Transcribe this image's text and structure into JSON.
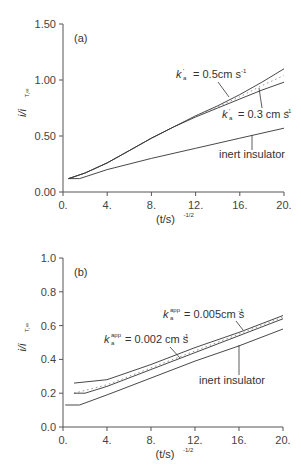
{
  "chart_data": [
    {
      "type": "line",
      "panel_label": "(a)",
      "xlabel": "(t/s)",
      "xlabel_exponent": "-1/2",
      "ylabel": "i/i",
      "ylabel_subscript": "T,∞",
      "xlim": [
        0,
        20
      ],
      "ylim": [
        0,
        1.5
      ],
      "xticks": [
        "0.",
        "4.",
        "8.",
        "12.",
        "16.",
        "20."
      ],
      "yticks": [
        "0.00",
        "0.50",
        "1.00",
        "1.50"
      ],
      "grid": false,
      "series": [
        {
          "name": "k'a = 0.5cm s-1",
          "style": "solid",
          "x": [
            0.5,
            2,
            4,
            6,
            8,
            10,
            12,
            14,
            16,
            18,
            20
          ],
          "y": [
            0.12,
            0.17,
            0.26,
            0.37,
            0.48,
            0.58,
            0.68,
            0.77,
            0.87,
            0.98,
            1.1
          ]
        },
        {
          "name": "dotted",
          "style": "dotted",
          "x": [
            0.5,
            2,
            4,
            6,
            8,
            10,
            12,
            14,
            16,
            18,
            20
          ],
          "y": [
            0.12,
            0.17,
            0.26,
            0.37,
            0.48,
            0.58,
            0.68,
            0.76,
            0.85,
            0.95,
            1.04
          ]
        },
        {
          "name": "k'a = 0.3 cm s-1",
          "style": "solid",
          "x": [
            0.5,
            2,
            4,
            6,
            8,
            10,
            12,
            14,
            16,
            18,
            20
          ],
          "y": [
            0.12,
            0.17,
            0.26,
            0.37,
            0.48,
            0.58,
            0.67,
            0.75,
            0.83,
            0.91,
            0.98
          ]
        },
        {
          "name": "inert insulator",
          "style": "solid",
          "x": [
            0.5,
            1.5,
            4,
            8,
            12,
            16,
            20
          ],
          "y": [
            0.12,
            0.12,
            0.2,
            0.3,
            0.39,
            0.48,
            0.57
          ]
        }
      ],
      "annotations": [
        {
          "text": "k'a = 0.5cm s-1",
          "k_sup": "'",
          "k_sub": "a",
          "value": "= 0.5cm s",
          "unit_exp": "-1"
        },
        {
          "text": "k'a = 0.3 cm s-1",
          "k_sup": "'",
          "k_sub": "a",
          "value": "= 0.3 cm s",
          "unit_exp": "-1"
        },
        {
          "text": "inert insulator"
        }
      ]
    },
    {
      "type": "line",
      "panel_label": "(b)",
      "xlabel": "(t/s)",
      "xlabel_exponent": "-1/2",
      "ylabel": "i/i",
      "ylabel_subscript": "T,∞",
      "xlim": [
        0,
        20
      ],
      "ylim": [
        0,
        1.0
      ],
      "xticks": [
        "0.",
        "4.",
        "8.",
        "12.",
        "16.",
        "20."
      ],
      "yticks": [
        "0.0",
        "0.2",
        "0.4",
        "0.6",
        "0.8",
        "1.0"
      ],
      "grid": false,
      "series": [
        {
          "name": "k_a^app = 0.005cm s-1",
          "style": "solid",
          "x": [
            1,
            4,
            8,
            12,
            16,
            20
          ],
          "y": [
            0.26,
            0.28,
            0.37,
            0.47,
            0.56,
            0.66
          ]
        },
        {
          "name": "dotted",
          "style": "dotted",
          "x": [
            1,
            4,
            8,
            12,
            16,
            20
          ],
          "y": [
            0.2,
            0.25,
            0.35,
            0.45,
            0.55,
            0.65
          ]
        },
        {
          "name": "k_a^app = 0.002 cm s-1",
          "style": "solid",
          "x": [
            1,
            2,
            4,
            8,
            12,
            16,
            20
          ],
          "y": [
            0.2,
            0.2,
            0.24,
            0.34,
            0.44,
            0.54,
            0.64
          ]
        },
        {
          "name": "inert insulator",
          "style": "solid",
          "x": [
            0.2,
            1.5,
            4,
            8,
            12,
            16,
            20
          ],
          "y": [
            0.13,
            0.13,
            0.19,
            0.29,
            0.39,
            0.48,
            0.58
          ]
        }
      ],
      "annotations": [
        {
          "text": "k_a^app = 0.005cm s-1",
          "k_sup": "app",
          "k_sub": "a",
          "value": "= 0.005cm s",
          "unit_exp": "-1"
        },
        {
          "text": "k_a^app = 0.002 cm s-1",
          "k_sup": "app",
          "k_sub": "a",
          "value": "= 0.002 cm s",
          "unit_exp": "-1"
        },
        {
          "text": "inert insulator"
        }
      ]
    }
  ],
  "colors": {
    "line": "#333333",
    "axis": "#555555",
    "dotted": "#888888"
  }
}
